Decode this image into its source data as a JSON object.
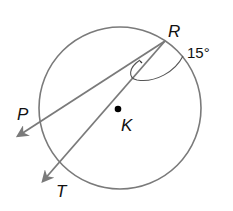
{
  "diagram": {
    "type": "circle-geometry",
    "circle": {
      "center_label": "K"
    },
    "points": [
      {
        "label": "R"
      },
      {
        "label": "P"
      },
      {
        "label": "K"
      },
      {
        "label": "T"
      }
    ],
    "rays": [
      {
        "from": "R",
        "through": "P"
      },
      {
        "from": "R",
        "through": "T"
      }
    ],
    "angle": {
      "vertex": "R",
      "measure": "15°"
    },
    "colors": {
      "stroke": "#7a7a7a",
      "text": "#111111",
      "center_dot": "#000000"
    }
  }
}
